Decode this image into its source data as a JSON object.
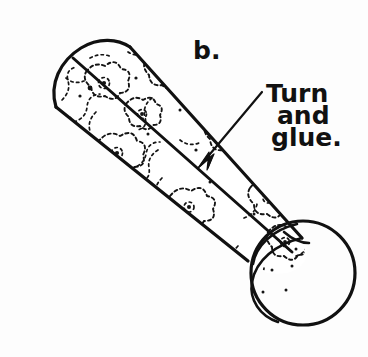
{
  "figure": {
    "step_label": "b.",
    "caption_lines": [
      "Turn",
      "and",
      "glue."
    ],
    "caption_full": "Turn and glue.",
    "annotation_target": "seam-line",
    "colors": {
      "ink": "#111111",
      "background": "#fdfdfd",
      "pattern": "#141414"
    },
    "parts": {
      "tube_body": "rolled-paper-cylinder",
      "tube_opening": "open-end-circle",
      "tube_cap": "rounded-left-end",
      "seam": "glued-overlap-seam",
      "pointer": "leader-line-with-arrow"
    }
  }
}
